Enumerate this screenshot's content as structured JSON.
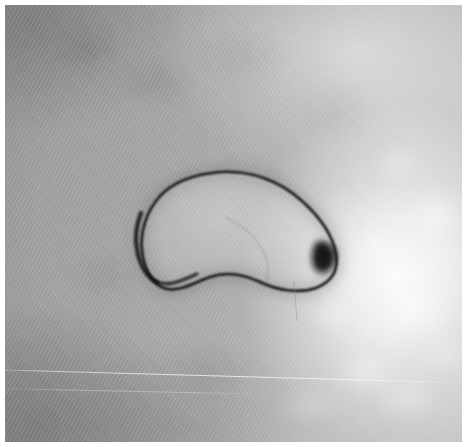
{
  "image": {
    "kind": "electron-micrograph",
    "modality_label": "grayscale transmission electron micrograph",
    "width_px": 465,
    "height_px": 447,
    "paper_margin_px": 5,
    "background_color": "#a9a9a9",
    "paper_color": "#ffffff",
    "outline_color": "#141414",
    "bright_patch_color": "#ececec",
    "dark_corner_color": "#8f8f8f"
  },
  "subject": {
    "name": "vesicle-outline",
    "description": "dark closed contour of a rounded kidney-bean shaped vesicle",
    "center_x_px": 236,
    "center_y_px": 228,
    "width_px": 198,
    "height_px": 136,
    "outline_stroke_px": 2.6,
    "dense_knot": {
      "name": "membrane-knot",
      "x_px": 328,
      "y_px": 255,
      "radius_px": 10
    },
    "contour_path": "M 215 167 C 246 165, 275 176, 297 196 C 316 213, 328 232, 331 249 C 334 266, 326 277, 311 283 C 294 289, 272 285, 255 277 C 238 269, 222 266, 205 272 C 188 278, 173 288, 159 283 C 146 278, 139 263, 137 246 C 135 227, 141 207, 155 191 C 170 175, 192 169, 215 167 Z"
  },
  "regions": [
    {
      "name": "upper-left-dark-field",
      "tone": "mid-gray",
      "relative_brightness": 0.58
    },
    {
      "name": "right-bright-field",
      "tone": "near-white mottled",
      "relative_brightness": 0.92
    },
    {
      "name": "lower-left-dark-field",
      "tone": "darker gray",
      "relative_brightness": 0.54
    },
    {
      "name": "vesicle-interior",
      "tone": "light gray",
      "relative_brightness": 0.74
    }
  ],
  "artifacts": [
    {
      "name": "diagonal-scratch-line",
      "description": "faint bright diagonal streak across lower third"
    },
    {
      "name": "scan-striations",
      "description": "fine diagonal raster striping over whole frame"
    }
  ]
}
